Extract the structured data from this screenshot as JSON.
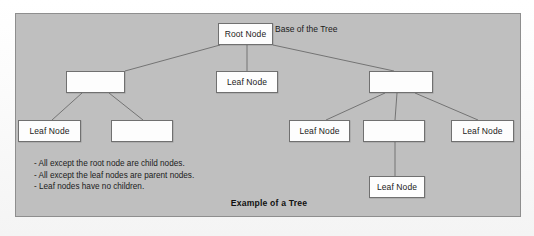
{
  "figure": {
    "caption": "Example of a Tree",
    "panel_color": "#bfbfbf",
    "node_fill": "#fdfdfd",
    "node_border": "#707070",
    "edge_color": "#6b6b6b"
  },
  "labels": {
    "base_of_tree": "Base of the Tree"
  },
  "notes": [
    "- All except the root node are child nodes.",
    "- All except the leaf nodes are parent nodes.",
    "- Leaf nodes have no children."
  ],
  "nodes": [
    {
      "id": "root",
      "label": "Root Node",
      "x": 202,
      "y": 9,
      "w": 55,
      "h": 22
    },
    {
      "id": "l2-left",
      "label": "",
      "x": 50,
      "y": 57,
      "w": 59,
      "h": 22
    },
    {
      "id": "l2-mid",
      "label": "Leaf Node",
      "x": 200,
      "y": 57,
      "w": 62,
      "h": 22
    },
    {
      "id": "l2-right",
      "label": "",
      "x": 353,
      "y": 57,
      "w": 64,
      "h": 22
    },
    {
      "id": "l3-a",
      "label": "Leaf Node",
      "x": 2,
      "y": 106,
      "w": 63,
      "h": 22
    },
    {
      "id": "l3-b",
      "label": "",
      "x": 95,
      "y": 106,
      "w": 62,
      "h": 22
    },
    {
      "id": "l3-c",
      "label": "Leaf Node",
      "x": 273,
      "y": 106,
      "w": 61,
      "h": 22
    },
    {
      "id": "l3-d",
      "label": "",
      "x": 347,
      "y": 106,
      "w": 62,
      "h": 22
    },
    {
      "id": "l3-e",
      "label": "Leaf Node",
      "x": 435,
      "y": 106,
      "w": 63,
      "h": 22
    },
    {
      "id": "l4-a",
      "label": "Leaf Node",
      "x": 353,
      "y": 162,
      "w": 56,
      "h": 22
    }
  ],
  "edges": [
    {
      "from": "root",
      "to": "l2-left",
      "x1": 204,
      "y1": 31,
      "x2": 109,
      "y2": 57
    },
    {
      "from": "root",
      "to": "l2-mid",
      "x1": 231,
      "y1": 31,
      "x2": 231,
      "y2": 57
    },
    {
      "from": "root",
      "to": "l2-right",
      "x1": 257,
      "y1": 31,
      "x2": 378,
      "y2": 57
    },
    {
      "from": "l2-left",
      "to": "l3-a",
      "x1": 66,
      "y1": 79,
      "x2": 36,
      "y2": 106
    },
    {
      "from": "l2-left",
      "to": "l3-b",
      "x1": 93,
      "y1": 79,
      "x2": 127,
      "y2": 106
    },
    {
      "from": "l2-right",
      "to": "l3-c",
      "x1": 369,
      "y1": 79,
      "x2": 310,
      "y2": 106
    },
    {
      "from": "l2-right",
      "to": "l3-d",
      "x1": 381,
      "y1": 79,
      "x2": 379,
      "y2": 106
    },
    {
      "from": "l2-right",
      "to": "l3-e",
      "x1": 399,
      "y1": 79,
      "x2": 462,
      "y2": 106
    },
    {
      "from": "l3-d",
      "to": "l4-a",
      "x1": 379,
      "y1": 128,
      "x2": 379,
      "y2": 162
    }
  ]
}
